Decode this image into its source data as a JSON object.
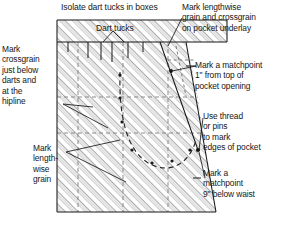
{
  "diagram": {
    "colors": {
      "ink": "#161616",
      "hatch": "#9a9a9a",
      "dashed_grid": "#8d8d8d",
      "pocket_dash": "#2a2a2a",
      "paper": "#ffffff"
    }
  },
  "annotations": {
    "isolate_dart_tucks": "Isolate dart tucks in boxes",
    "dart_tucks": "Dart tucks",
    "mark_crossgrain": "Mark\ncrossgrain\njust below\ndarts and\nat the\nhipline",
    "mark_lengthwise_grain": "Mark\nlength-\nwise\ngrain",
    "pocket_underlay": "Mark lengthwise\ngrain and crossgrain\non pocket underlay",
    "matchpoint_one_inch": "Mark a matchpoint\n1\" from top of\npocket opening",
    "use_thread_or_pins": "Use thread\nor pins\nto mark\nedges of pocket",
    "matchpoint_nine_inch": "Mark a\nmatchpoint\n9\" below waist"
  },
  "features": {
    "waistline_label": "waistline",
    "hipline_label": "hipline",
    "dart_tuck_count": 4,
    "matchpoint_count": 2,
    "pocket_curve_dot_count": 7
  }
}
